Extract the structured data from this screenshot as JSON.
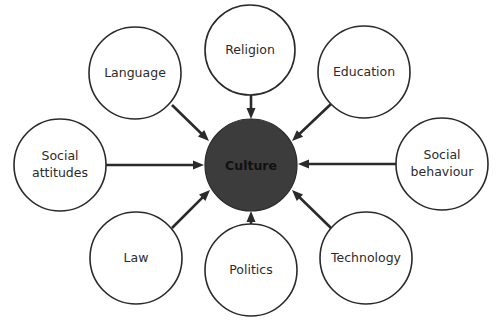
{
  "diagram": {
    "type": "hub-and-spoke",
    "center": {
      "label": "Culture",
      "x": 251,
      "y": 165,
      "r": 46,
      "fill": "#3c3c3c"
    },
    "nodes": [
      {
        "id": "language",
        "lines": [
          "Language"
        ],
        "x": 135,
        "y": 73,
        "r": 46,
        "arrow": {
          "x1": 172,
          "y1": 105,
          "x2": 209,
          "y2": 141
        }
      },
      {
        "id": "religion",
        "lines": [
          "Religion"
        ],
        "x": 250,
        "y": 50,
        "r": 45,
        "arrow": {
          "x1": 251,
          "y1": 95,
          "x2": 251,
          "y2": 119
        }
      },
      {
        "id": "education",
        "lines": [
          "Education"
        ],
        "x": 364,
        "y": 72,
        "r": 46,
        "arrow": {
          "x1": 331,
          "y1": 104,
          "x2": 292,
          "y2": 141
        }
      },
      {
        "id": "social-attitudes",
        "lines": [
          "Social",
          "attitudes"
        ],
        "x": 60,
        "y": 165,
        "r": 46,
        "arrow": {
          "x1": 106,
          "y1": 165,
          "x2": 204,
          "y2": 165
        }
      },
      {
        "id": "social-behaviour",
        "lines": [
          "Social",
          "behaviour"
        ],
        "x": 442,
        "y": 164,
        "r": 46,
        "arrow": {
          "x1": 396,
          "y1": 164,
          "x2": 298,
          "y2": 164
        }
      },
      {
        "id": "law",
        "lines": [
          "Law"
        ],
        "x": 136,
        "y": 258,
        "r": 46,
        "arrow": {
          "x1": 172,
          "y1": 228,
          "x2": 210,
          "y2": 190
        }
      },
      {
        "id": "politics",
        "lines": [
          "Politics"
        ],
        "x": 251,
        "y": 270,
        "r": 46,
        "arrow": {
          "x1": 251,
          "y1": 224,
          "x2": 251,
          "y2": 211
        }
      },
      {
        "id": "technology",
        "lines": [
          "Technology"
        ],
        "x": 366,
        "y": 258,
        "r": 46,
        "arrow": {
          "x1": 331,
          "y1": 228,
          "x2": 292,
          "y2": 190
        }
      }
    ]
  }
}
